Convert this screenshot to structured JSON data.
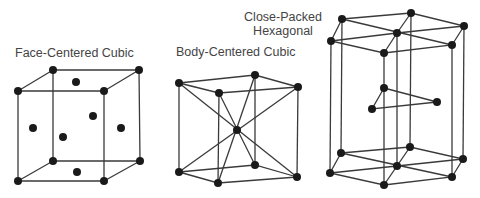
{
  "labels": {
    "fcc": "Face-Centered Cubic",
    "bcc": "Body-Centered Cubic",
    "hcp_line1": "Close-Packed",
    "hcp_line2": "Hexagonal"
  },
  "colors": {
    "line": "#3a3a3a",
    "atom": "#1a1a1a",
    "text": "#444444",
    "background": "#ffffff"
  },
  "structures": [
    {
      "id": "fcc",
      "name": "Face-Centered Cubic",
      "corner_atoms": 8,
      "face_atoms": 6
    },
    {
      "id": "bcc",
      "name": "Body-Centered Cubic",
      "corner_atoms": 8,
      "center_atoms": 1
    },
    {
      "id": "hcp",
      "name": "Close-Packed Hexagonal",
      "top_layer_atoms": 7,
      "middle_layer_atoms": 3,
      "bottom_layer_atoms": 7
    }
  ]
}
